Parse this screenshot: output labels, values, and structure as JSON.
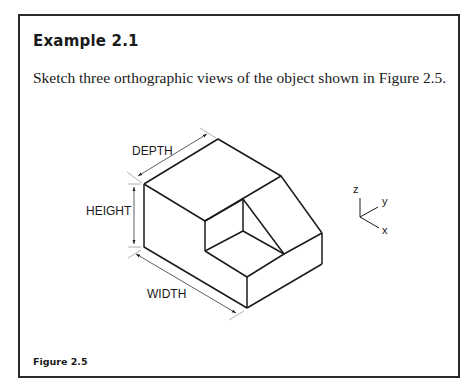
{
  "example": {
    "title": "Example 2.1",
    "prompt": "Sketch three orthographic views of the object shown in Figure 2.5."
  },
  "figure": {
    "caption": "Figure 2.5",
    "dimensions": {
      "depth": "DEPTH",
      "height": "HEIGHT",
      "width": "WIDTH"
    },
    "axes": {
      "z": "z",
      "y": "y",
      "x": "x"
    }
  },
  "colors": {
    "line": "#1a1a1a",
    "dimension_line": "#9a9a9a",
    "border": "#2a2a2a"
  }
}
